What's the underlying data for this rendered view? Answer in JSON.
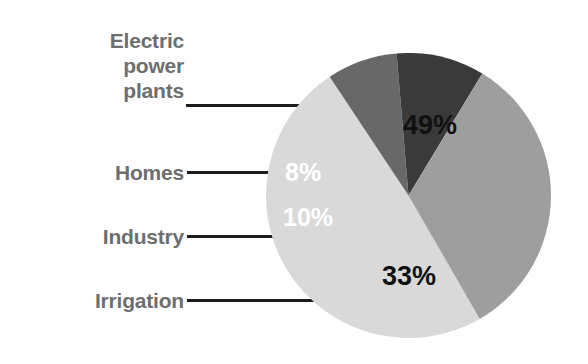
{
  "chart_data": {
    "type": "pie",
    "title": "",
    "subtitle": "",
    "xlabel": "",
    "ylabel": "",
    "legend_position": "callout-labels-left",
    "grid": false,
    "categories": [
      "Electric power plants",
      "Homes",
      "Industry",
      "Irrigation"
    ],
    "values": [
      49,
      8,
      10,
      33
    ],
    "value_labels": [
      "49%",
      "8%",
      "10%",
      "33%"
    ],
    "slice_colors": [
      "#d9d9d9",
      "#686868",
      "#3a3a3a",
      "#9e9e9e"
    ],
    "value_label_colors": [
      "#111111",
      "#ffffff",
      "#ffffff",
      "#111111"
    ],
    "units": "percent"
  },
  "figure": {
    "background_color": "#ffffff",
    "label_color": "#6e6e6e",
    "leader_line_color": "#1c1c1c"
  },
  "labels": {
    "electric": "Electric\npower\nplants",
    "homes": "Homes",
    "industry": "Industry",
    "irrigation": "Irrigation"
  },
  "values": {
    "electric": "49%",
    "homes": "8%",
    "industry": "10%",
    "irrigation": "33%"
  }
}
